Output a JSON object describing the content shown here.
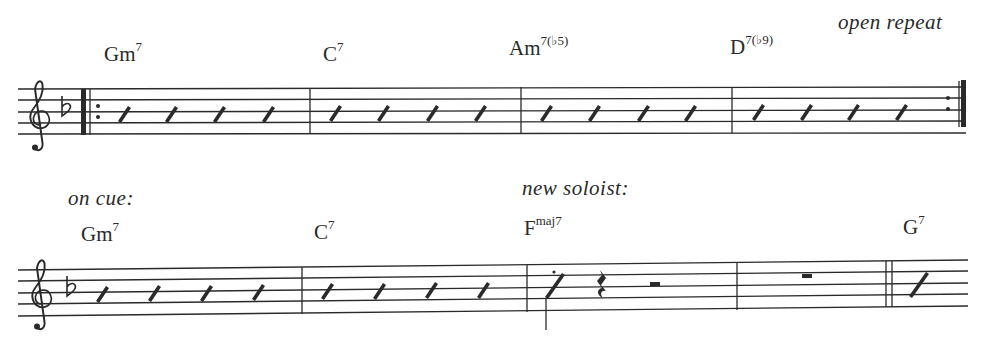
{
  "score": {
    "key_signature": "F major / D minor (one flat)",
    "clef": "treble",
    "systems": [
      {
        "index": 1,
        "directions": [
          {
            "text": "open repeat",
            "x": 838,
            "y": 14
          }
        ],
        "chords": [
          {
            "root": "Gm",
            "ext": "7",
            "x": 104,
            "y": 44
          },
          {
            "root": "C",
            "ext": "7",
            "x": 323,
            "y": 44
          },
          {
            "root": "Am",
            "ext": "7(♭5)",
            "x": 509,
            "y": 38
          },
          {
            "root": "D",
            "ext": "7(♭9)",
            "x": 730,
            "y": 37
          }
        ],
        "measures": [
          {
            "index": 1,
            "content": "4 slashes",
            "start_barline": "repeat-start"
          },
          {
            "index": 2,
            "content": "4 slashes"
          },
          {
            "index": 3,
            "content": "4 slashes"
          },
          {
            "index": 4,
            "content": "4 slashes",
            "end_barline": "repeat-end"
          }
        ]
      },
      {
        "index": 2,
        "directions": [
          {
            "text": "on cue:",
            "x": 68,
            "y": 190
          },
          {
            "text": "new soloist:",
            "x": 522,
            "y": 180
          }
        ],
        "chords": [
          {
            "root": "Gm",
            "ext": "7",
            "x": 81,
            "y": 224
          },
          {
            "root": "C",
            "ext": "7",
            "x": 314,
            "y": 222
          },
          {
            "root": "F",
            "ext": "maj7",
            "x": 524,
            "y": 218
          },
          {
            "root": "G",
            "ext": "7",
            "x": 903,
            "y": 217
          }
        ],
        "measures": [
          {
            "index": 1,
            "content": "4 slashes"
          },
          {
            "index": 2,
            "content": "4 slashes"
          },
          {
            "index": 3,
            "content": "staccato slash, quarter rest, half rest"
          },
          {
            "index": 4,
            "content": "whole rest",
            "end_barline": "double"
          },
          {
            "index": 5,
            "content": "1 slash (continues)"
          }
        ]
      }
    ]
  },
  "text": {
    "open_repeat": "open repeat",
    "on_cue": "on cue:",
    "new_soloist": "new soloist:",
    "chords_row1": [
      {
        "root": "Gm",
        "ext": "7"
      },
      {
        "root": "C",
        "ext": "7"
      },
      {
        "root": "Am",
        "ext": "7(♭5)"
      },
      {
        "root": "D",
        "ext": "7(♭9)"
      }
    ],
    "chords_row2": [
      {
        "root": "Gm",
        "ext": "7"
      },
      {
        "root": "C",
        "ext": "7"
      },
      {
        "root": "F",
        "ext": "maj7"
      },
      {
        "root": "G",
        "ext": "7"
      }
    ]
  },
  "colors": {
    "ink": "#2a2a2a",
    "paper": "#ffffff"
  }
}
